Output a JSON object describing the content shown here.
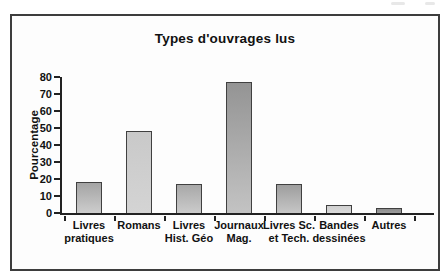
{
  "chart_data": {
    "type": "bar",
    "title": "Types d'ouvrages lus",
    "ylabel": "Pourcentage",
    "xlabel": "",
    "categories": [
      [
        "Livres",
        "pratiques"
      ],
      [
        "Romans"
      ],
      [
        "Livres",
        "Hist. Géo"
      ],
      [
        "Journaux",
        "Mag."
      ],
      [
        "Livres Sc.",
        "et Tech."
      ],
      [
        "Bandes",
        "dessinées"
      ],
      [
        "Autres"
      ]
    ],
    "values": [
      18,
      48,
      17,
      77,
      17,
      5,
      3
    ],
    "ylim": [
      0,
      80
    ],
    "yticks": [
      0,
      10,
      20,
      30,
      40,
      50,
      60,
      70,
      80
    ],
    "grid": false,
    "legend": "none",
    "axis_color": "#222222",
    "frame_border_color": "#3d3d3d",
    "bar_colors": [
      {
        "top": "#a4a4a4",
        "bottom": "#cdcdcd"
      },
      {
        "top": "#c9c9c9",
        "bottom": "#d4d4d4"
      },
      {
        "top": "#a8a8a8",
        "bottom": "#cbcbcb"
      },
      {
        "top": "#949494",
        "bottom": "#c3c3c3"
      },
      {
        "top": "#9e9e9e",
        "bottom": "#c6c6c6"
      },
      {
        "top": "#d0d0d0",
        "bottom": "#d9d9d9"
      },
      {
        "top": "#8d8d8d",
        "bottom": "#9c9c9c"
      }
    ]
  }
}
